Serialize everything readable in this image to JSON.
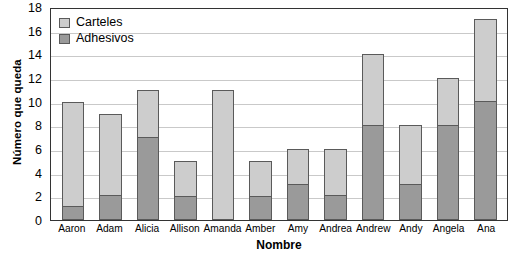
{
  "chart_data": {
    "type": "bar",
    "title": "",
    "xlabel": "Nombre",
    "ylabel": "Número que queda",
    "ylim": [
      0,
      18
    ],
    "ytick_step": 2,
    "yticks": [
      18,
      16,
      14,
      12,
      10,
      8,
      6,
      4,
      2,
      0
    ],
    "grid": true,
    "stacked": true,
    "legend_position": "top-left-inside",
    "categories": [
      "Aaron",
      "Adam",
      "Alicia",
      "Allison",
      "Amanda",
      "Amber",
      "Amy",
      "Andrea",
      "Andrew",
      "Andy",
      "Angela",
      "Ana"
    ],
    "series": [
      {
        "name": "Adhesivos",
        "color": "#9a9a9a",
        "values": [
          1,
          2,
          7,
          2,
          0,
          2,
          3,
          2,
          8,
          3,
          8,
          10
        ]
      },
      {
        "name": "Carteles",
        "color": "#cdcdcd",
        "values": [
          9,
          7,
          4,
          3,
          11,
          3,
          3,
          4,
          6,
          5,
          4,
          7
        ]
      }
    ],
    "totals": [
      10,
      9,
      11,
      5,
      11,
      5,
      6,
      6,
      14,
      8,
      12,
      17
    ]
  },
  "legend": {
    "items": [
      {
        "label": "Carteles",
        "swatch": "light-gray-swatch"
      },
      {
        "label": "Adhesivos",
        "swatch": "dark-gray-swatch"
      }
    ]
  },
  "axes": {
    "y_title": "Número que queda",
    "x_title": "Nombre"
  }
}
